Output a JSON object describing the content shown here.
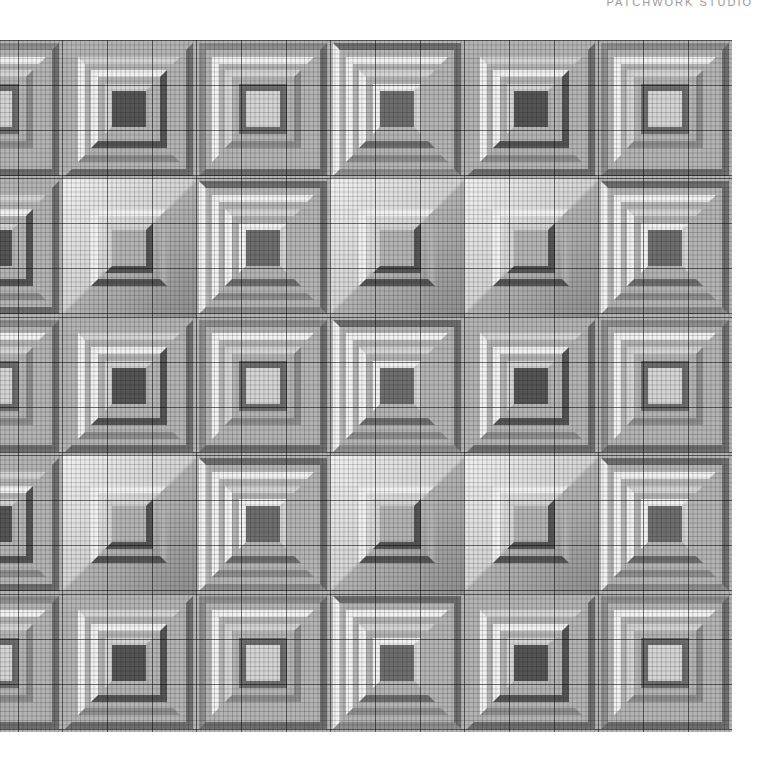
{
  "header": {
    "title": "PATCHWORK STUDIO"
  },
  "palette": {
    "white": "#f1f1f1",
    "light": "#d4d4d4",
    "mid": "#b3b3b3",
    "dark": "#8e8e8e",
    "darker": "#6e6e6e",
    "darkest": "#555555"
  },
  "quilt": {
    "rows": 5,
    "cols": 6,
    "block_types": [
      [
        "ring",
        "L",
        "ring",
        "box",
        "L",
        "ring"
      ],
      [
        "L",
        "diag",
        "box",
        "diag",
        "diag",
        "box"
      ],
      [
        "ring",
        "L",
        "ring",
        "box",
        "L",
        "ring"
      ],
      [
        "L",
        "diag",
        "box",
        "diag",
        "diag",
        "box"
      ],
      [
        "ring",
        "L",
        "ring",
        "box",
        "L",
        "ring"
      ]
    ]
  }
}
